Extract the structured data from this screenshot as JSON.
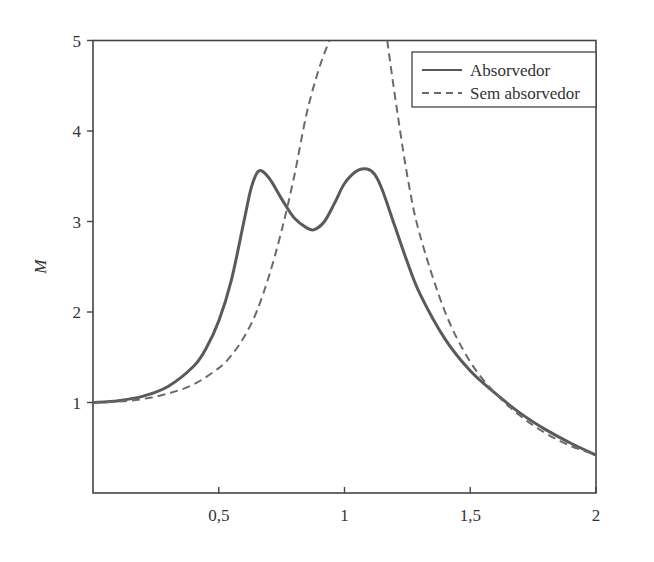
{
  "chart_data": {
    "type": "line",
    "title": "",
    "xlabel": "",
    "ylabel": "M",
    "xlim": [
      0,
      2
    ],
    "ylim": [
      0.0,
      5
    ],
    "x_ticks": [
      0.5,
      1,
      1.5,
      2
    ],
    "x_tick_labels": [
      "0,5",
      "1",
      "1,5",
      "2"
    ],
    "y_ticks": [
      1,
      2,
      3,
      4,
      5
    ],
    "y_tick_labels": [
      "1",
      "2",
      "3",
      "4",
      "5"
    ],
    "grid": false,
    "legend_position": "upper right",
    "series": [
      {
        "name": "Absorvedor",
        "style": "solid",
        "color": "#5a5a5a",
        "x": [
          0,
          0.1,
          0.2,
          0.3,
          0.4,
          0.45,
          0.5,
          0.55,
          0.6,
          0.63,
          0.66,
          0.7,
          0.75,
          0.8,
          0.85,
          0.88,
          0.92,
          0.96,
          1.0,
          1.05,
          1.09,
          1.12,
          1.15,
          1.2,
          1.25,
          1.3,
          1.4,
          1.5,
          1.6,
          1.7,
          1.8,
          1.9,
          2.0
        ],
        "y": [
          1.0,
          1.02,
          1.07,
          1.18,
          1.4,
          1.6,
          1.9,
          2.35,
          3.0,
          3.38,
          3.56,
          3.48,
          3.25,
          3.04,
          2.93,
          2.91,
          3.0,
          3.2,
          3.42,
          3.56,
          3.58,
          3.52,
          3.35,
          2.95,
          2.55,
          2.2,
          1.7,
          1.35,
          1.1,
          0.88,
          0.7,
          0.55,
          0.42
        ]
      },
      {
        "name": "Sem absorvedor",
        "style": "dashed",
        "color": "#6a6a6a",
        "x": [
          0,
          0.1,
          0.2,
          0.3,
          0.4,
          0.5,
          0.55,
          0.6,
          0.65,
          0.7,
          0.75,
          0.8,
          0.85,
          0.9,
          0.94,
          1.17,
          1.2,
          1.25,
          1.3,
          1.4,
          1.5,
          1.6,
          1.7,
          1.8,
          1.9,
          2.0
        ],
        "y": [
          1.0,
          1.01,
          1.04,
          1.1,
          1.2,
          1.38,
          1.52,
          1.72,
          2.0,
          2.4,
          2.9,
          3.5,
          4.2,
          4.7,
          5.0,
          5.0,
          4.4,
          3.5,
          2.85,
          2.0,
          1.45,
          1.1,
          0.85,
          0.66,
          0.52,
          0.42
        ]
      }
    ]
  }
}
